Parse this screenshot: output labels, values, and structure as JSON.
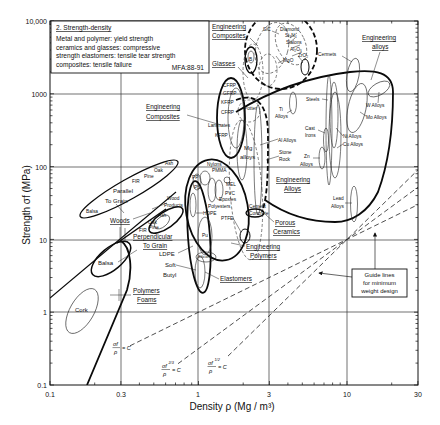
{
  "chart_data": {
    "type": "scatter",
    "chart_kind": "Ashby material-selection chart (log-log property envelopes)",
    "title": "2. Strength-density",
    "subtitle": [
      "Metal and polymer: yield strength",
      "ceramics and glasses: compressive",
      "strength elastomers: tensile tear strength",
      "composites: tensile failure"
    ],
    "code": "MFA:88-91",
    "xlabel": "Density ρ (Mg / m³)",
    "ylabel": "Strength σf (MPa)",
    "xscale": "log",
    "yscale": "log",
    "xlim": [
      0.1,
      30
    ],
    "ylim": [
      0.1,
      10000
    ],
    "x_ticks": [
      "0.1",
      "0.3",
      "1",
      "3",
      "10",
      "30"
    ],
    "y_ticks": [
      "10,000",
      "1000",
      "100",
      "10",
      "1",
      "0.1"
    ],
    "grid": true,
    "legend_position": "top-left boxed note",
    "families": [
      {
        "id": "ceramics",
        "label": null,
        "outline": "thick dashed",
        "density": [
          2.1,
          6.0
        ],
        "strength": [
          1200,
          10000
        ],
        "members": [
          "SiC",
          "Diamond",
          "Si₃N₄",
          "Sialons",
          "Al₂O₃",
          "MgO",
          "ZrO₂",
          "B"
        ]
      },
      {
        "id": "glasses",
        "label": "Glasses",
        "outline": "dashed",
        "density": [
          2.2,
          2.7
        ],
        "strength": [
          300,
          1800
        ]
      },
      {
        "id": "engineering-composites",
        "label": "Engineering Composites",
        "outline": "thick solid",
        "density": [
          1.3,
          2.0
        ],
        "strength": [
          120,
          1300
        ],
        "members": [
          "CFRP",
          "GFRP",
          "KFRP",
          "CFRP",
          "Laminates",
          "KFRP"
        ]
      },
      {
        "id": "engineering-alloys",
        "label": "Engineering Alloys",
        "outline": "thick solid",
        "density": [
          2.4,
          20
        ],
        "strength": [
          17,
          2000
        ],
        "members": [
          "Cermets",
          "W Alloys",
          "Mo Alloys",
          "Steels",
          "Ti Alloys",
          "Cast Irons",
          "Ni Alloys",
          "Cu Alloys",
          "Mg alloys",
          "Al Alloys",
          "Zn Alloys",
          "Lead Alloys"
        ]
      },
      {
        "id": "porous-ceramics",
        "label": "Porous Ceramics",
        "outline": "thick dashed",
        "density": [
          1.6,
          3.2
        ],
        "strength": [
          5,
          300
        ],
        "members": [
          "Potter",
          "Stone Rock",
          "Cement Concrete"
        ]
      },
      {
        "id": "engineering-polymers",
        "label": "Engineering Polymers",
        "outline": "thick solid",
        "density": [
          0.85,
          2.1
        ],
        "strength": [
          5,
          120
        ],
        "members": [
          "Nylons",
          "PMMA",
          "PP",
          "PS",
          "MEL",
          "PVC",
          "Epoxies",
          "Polyesters",
          "HDPE",
          "PTFE",
          "LDPE"
        ]
      },
      {
        "id": "elastomers",
        "label": "Elastomers",
        "outline": "thick solid",
        "density": [
          0.85,
          1.2
        ],
        "strength": [
          1.5,
          75
        ],
        "members": [
          "Pu",
          "Silicone",
          "Soft Butyl"
        ]
      },
      {
        "id": "woods-parallel",
        "label": "Parallel To Grain",
        "outline": "solid",
        "density": [
          0.17,
          0.7
        ],
        "strength": [
          20,
          110
        ],
        "members": [
          "Balsa",
          "FIR",
          "Pine",
          "Oak",
          "Ash"
        ]
      },
      {
        "id": "woods-perpendicular",
        "label": "Perpendicular To Grain",
        "outline": "thick solid",
        "density": [
          0.3,
          0.9
        ],
        "strength": [
          1.5,
          20
        ],
        "members": [
          "Wood Products",
          "Ash",
          "Oak",
          "Pine",
          "FIR",
          "Balsa"
        ]
      },
      {
        "id": "polymer-foams",
        "label": "Polymers Foams",
        "outline": "thick solid",
        "density": [
          0.1,
          0.3
        ],
        "strength": [
          0.1,
          10
        ],
        "members": [
          "Cork"
        ]
      }
    ],
    "guide_lines": [
      {
        "label": "σf/ρ = C",
        "num": "σf",
        "exp": "",
        "den": "ρ",
        "rhs": "= C",
        "slope": 1
      },
      {
        "label": "σf^(2/3)/ρ = C",
        "num": "σf",
        "exp": "2/3",
        "den": "ρ",
        "rhs": "= C",
        "slope": 1.5
      },
      {
        "label": "σf^(1/2)/ρ = C",
        "num": "σf",
        "exp": "1/2",
        "den": "ρ",
        "rhs": "= C",
        "slope": 2
      }
    ],
    "guide_lines_through": [
      10,
      10
    ],
    "guide_note": [
      "Guide lines",
      "for minimum",
      "weight design"
    ],
    "labels": {
      "eng_comp_top_1": "Engineering",
      "eng_comp_top_2": "Composites",
      "glasses": "Glasses",
      "sic": "SiC",
      "diamond": "Diamond",
      "si3n4": "Si₃N₄",
      "sialons": "Sialons",
      "al2o3": "Al₂O₃",
      "mgo": "MgO",
      "zro2": "ZrO₂",
      "b": "B",
      "cermets": "Cermets",
      "eng_alloys_1": "Engineering",
      "eng_alloys_2": "alloys",
      "cfrp1": "CFRP",
      "gfrp": "GFRP",
      "kfrp1": "KFRP",
      "cfrp2": "CFRP",
      "laminates": "Laminates",
      "kfrp2": "KFRP",
      "eng_comp_1": "Engineering",
      "eng_comp_2": "Composites",
      "potter": "Potter",
      "mg": "Mg",
      "mg_alloys": "alloys",
      "steels": "Steels",
      "ti": "Ti",
      "ti_alloys": "Alloys",
      "w_alloys": "W Alloys",
      "mo_alloys": "Mo Alloys",
      "cast": "Cast",
      "irons": "Irons",
      "ni_alloys": "Ni Alloys",
      "cu_alloys": "Cu Alloys",
      "al_alloys": "Al Alloys",
      "stone": "Stone",
      "rock": "Rock",
      "zn": "Zn",
      "zn_alloys": "Alloys",
      "eng_alloys_b1": "Engineering",
      "eng_alloys_b2": "Alloys",
      "lead": "Lead",
      "lead_alloys": "Alloys",
      "cement": "Cement",
      "concrete": "Concrete",
      "porous": "Porous",
      "ceramics": "Ceramics",
      "nylons": "Nylons",
      "pmma": "PMMA",
      "pp": "PP",
      "ps": "PS",
      "mel": "MEL",
      "pvc": "PVC",
      "epoxies": "Epoxies",
      "polyesters": "Polyesters",
      "hdpe": "HDPE",
      "ptfe": "PTFE",
      "pu": "Pu",
      "silicone": "Silicone",
      "ldpe": "LDPE",
      "soft": "Soft",
      "butyl": "Butyl",
      "elastomers": "Elastomers",
      "eng_poly_1": "Engineering",
      "eng_poly_2": "Polymers",
      "ash_par": "Ash",
      "oak_par": "Oak",
      "pine_par": "Pine",
      "fir_par": "FIR",
      "balsa_par": "Balsa",
      "parallel": "Parallel",
      "to_grain_par": "To Grain",
      "woods": "Woods",
      "wood": "Wood",
      "products": "Products",
      "ash_perp": "Ash",
      "oak_perp": "Oak",
      "pine_perp": "Pine",
      "fir_perp": "FIR",
      "perpendicular": "Perpendicular",
      "to_grain_perp": "To Grain",
      "balsa_perp": "Balsa",
      "polymers": "Polymers",
      "foams": "Foams",
      "cork": "Cork"
    }
  }
}
